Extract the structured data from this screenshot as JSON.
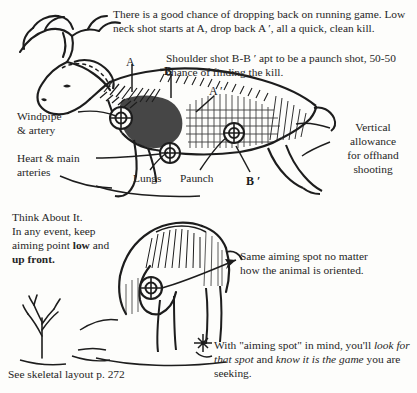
{
  "page": {
    "background_color": "#fdfdfb",
    "ink_color": "#1d1d1d"
  },
  "text_blocks": {
    "running_game": "There is a good chance of dropping back on running game. Low neck shot starts at A, drop back A ′, all a quick, clean kill.",
    "shoulder_shot": "Shoulder shot B-B ′ apt to be a paunch shot, 50-50 chance of finding the kill.",
    "think_about_it_line1": "Think About It.",
    "think_about_it_line2": "In any event, keep",
    "think_about_it_line3a": "aiming point ",
    "think_about_it_line3b": "low",
    "think_about_it_line3c": " and",
    "think_about_it_line4": "up front.",
    "same_aiming_spot": "Same aiming spot no matter how the animal is oriented.",
    "with_aiming_spot_a": "With \"aiming spot\" in mind, you'll ",
    "with_aiming_spot_b": "look for that spot",
    "with_aiming_spot_c": " and ",
    "with_aiming_spot_d": "know it is the game",
    "with_aiming_spot_e": " you are seeking.",
    "skeletal_reference": "See skeletal layout p. 272"
  },
  "anatomy_labels": {
    "windpipe": "Windpipe\n& artery",
    "heart": "Heart & main\narteries",
    "lungs": "Lungs",
    "paunch": "Paunch",
    "vertical_allowance": "Vertical\nallowance\nfor offhand\nshooting"
  },
  "shot_markers": {
    "a": "A",
    "b": "B",
    "a_prime": "A ′",
    "b_prime": "B ′"
  },
  "illustrations": {
    "upper": "running-buck-side-view-with-shot-zones",
    "lower": "grazing-deer-head-down-with-aiming-circle",
    "shrub": "bare-shrub-sapling",
    "target_circles": 4
  }
}
